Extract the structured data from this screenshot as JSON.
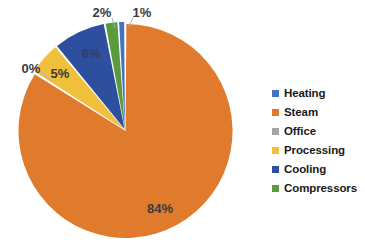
{
  "chart_data": {
    "type": "pie",
    "title": "",
    "subtitle": "",
    "xlabel": "",
    "ylabel": "",
    "grid": false,
    "legend_position": "right",
    "categories": [
      "Heating",
      "Steam",
      "Office",
      "Processing",
      "Cooling",
      "Compressors"
    ],
    "values": [
      1,
      84,
      0,
      5,
      8,
      2
    ],
    "value_labels": [
      "1%",
      "84%",
      "0%",
      "5%",
      "8%",
      "2%"
    ],
    "colors": [
      "#4472C4",
      "#E07B2E",
      "#A5A5A5",
      "#F0C03C",
      "#2E4E9E",
      "#5B9A3E"
    ],
    "slice_order_clockwise_from_top": [
      "Steam",
      "Office",
      "Processing",
      "Cooling",
      "Compressors",
      "Heating"
    ],
    "units": "percent",
    "total": 100
  },
  "legend": {
    "items": [
      {
        "label": "Heating",
        "color": "#4472C4"
      },
      {
        "label": "Steam",
        "color": "#E07B2E"
      },
      {
        "label": "Office",
        "color": "#A5A5A5"
      },
      {
        "label": "Processing",
        "color": "#F0C03C"
      },
      {
        "label": "Cooling",
        "color": "#2E4E9E"
      },
      {
        "label": "Compressors",
        "color": "#5B9A3E"
      }
    ]
  },
  "pie_labels": {
    "steam": "84%",
    "office": "0%",
    "processing": "5%",
    "cooling": "8%",
    "compressors": "2%",
    "heating": "1%"
  }
}
